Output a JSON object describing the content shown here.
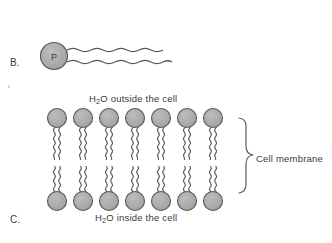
{
  "figure": {
    "title_parts": {
      "part_b_label": "B.",
      "part_c_label": "C."
    },
    "background_color": "#ffffff",
    "stroke_color": "#545454",
    "head_fill_color": "#a8a8a8",
    "text_color": "#3a3a3a"
  },
  "part_b": {
    "label": "B.",
    "molecule_name": "phospholipid",
    "head_letter": "P",
    "tail_count": 2,
    "description_hidden": ""
  },
  "part_c": {
    "label": "C.",
    "structure": "phospholipid-bilayer",
    "lipids_per_leaflet": 7,
    "leaflet_count": 2,
    "labels": {
      "outside_prefix": "H",
      "outside_subscript": "2",
      "outside_suffix": "O outside the cell",
      "inside_prefix": "H",
      "inside_subscript": "2",
      "inside_suffix": "O inside the cell",
      "membrane": "Cell membrane"
    }
  },
  "icons": {
    "brace": "right-curly-brace",
    "head": "phosphate-head-circle",
    "tail": "wavy-fatty-acid-tail"
  }
}
